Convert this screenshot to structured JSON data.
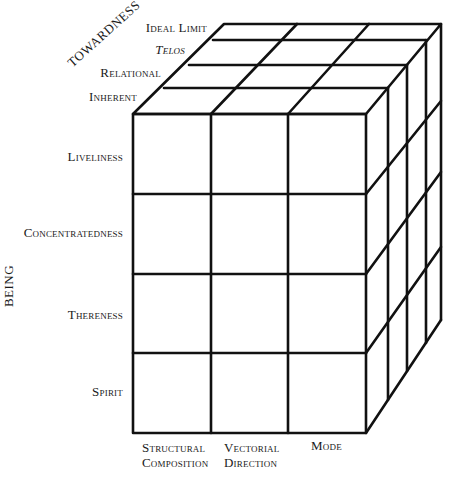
{
  "diagram": {
    "axes": {
      "depth": "TOWARDNESS",
      "vertical": "BEING"
    },
    "depth_levels": [
      {
        "label": "Ideal Limit",
        "italic": false
      },
      {
        "label": "Telos",
        "italic": true
      },
      {
        "label": "Relational",
        "italic": false
      },
      {
        "label": "Inherent",
        "italic": false
      }
    ],
    "rows": [
      {
        "label": "Liveliness"
      },
      {
        "label": "Concentratedness"
      },
      {
        "label": "Thereness"
      },
      {
        "label": "Spirit"
      }
    ],
    "columns": [
      {
        "label_line1": "Structural",
        "label_line2": "Composition"
      },
      {
        "label_line1": "Vectorial",
        "label_line2": "Direction"
      },
      {
        "label_line1": "Mode",
        "label_line2": ""
      }
    ],
    "structure": {
      "shape": "3D grid cube",
      "columns_count": 3,
      "rows_count": 4,
      "depth_count": 4,
      "line_color": "#111111",
      "background": "#ffffff"
    }
  }
}
